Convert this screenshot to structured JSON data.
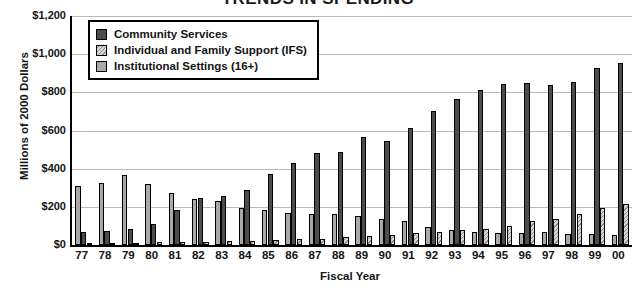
{
  "chart_data": {
    "type": "bar",
    "title": "TRENDS IN SPENDING",
    "xlabel": "Fiscal Year",
    "ylabel": "Millions of 2000 Dollars",
    "ylim": [
      0,
      1200
    ],
    "ytick_step": 200,
    "ytick_labels": [
      "$1,200",
      "$1,000",
      "$800",
      "$600",
      "$400",
      "$200",
      "$0"
    ],
    "ytick_values": [
      1200,
      1000,
      800,
      600,
      400,
      200,
      0
    ],
    "grid": true,
    "legend_position": "top-left-inside",
    "categories": [
      "77",
      "78",
      "79",
      "80",
      "81",
      "82",
      "83",
      "84",
      "85",
      "86",
      "87",
      "88",
      "89",
      "90",
      "91",
      "92",
      "93",
      "94",
      "95",
      "96",
      "97",
      "98",
      "99",
      "00"
    ],
    "series": [
      {
        "name": "Community Services",
        "color": "#4c4c4c",
        "pattern": "solid",
        "values": [
          70,
          75,
          85,
          110,
          185,
          245,
          255,
          290,
          370,
          430,
          480,
          485,
          565,
          545,
          615,
          700,
          765,
          810,
          845,
          850,
          840,
          855,
          925,
          955
        ]
      },
      {
        "name": "Individual and Family Support (IFS)",
        "color": "#d7d7d7",
        "pattern": "diagonal-hatch",
        "values": [
          8,
          10,
          12,
          14,
          16,
          18,
          20,
          22,
          26,
          30,
          34,
          40,
          46,
          55,
          62,
          70,
          78,
          85,
          100,
          125,
          135,
          160,
          195,
          215
        ]
      },
      {
        "name": "Institutional Settings (16+)",
        "color": "#a9a9a9",
        "pattern": "solid",
        "values": [
          310,
          325,
          365,
          320,
          270,
          240,
          230,
          195,
          185,
          170,
          160,
          165,
          150,
          135,
          125,
          95,
          80,
          70,
          65,
          62,
          68,
          60,
          58,
          55
        ]
      }
    ]
  }
}
